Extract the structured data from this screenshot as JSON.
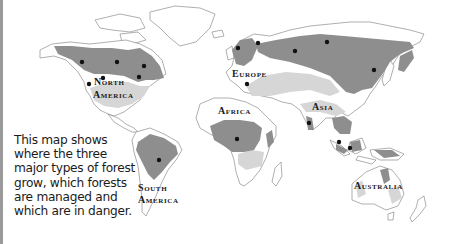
{
  "map": {
    "type": "world-forest-map",
    "colors": {
      "land": "#ffffff",
      "coastline": "#8c8c8c",
      "forest_dark": "#8e8e8e",
      "forest_light": "#d6d6d6",
      "marker": "#111111",
      "frame_border": "#9a9a9a"
    },
    "legend": null
  },
  "labels": {
    "north_america_1": "North",
    "north_america_2": "America",
    "south_america_1": "South",
    "south_america_2": "America",
    "europe": "Europe",
    "africa": "Africa",
    "asia": "Asia",
    "australia": "Australia"
  },
  "caption": {
    "text": "This map shows where the three major types of forest grow, which forests are managed and which are in danger."
  },
  "markers": [
    {
      "region": "North America",
      "x": 82,
      "y": 62
    },
    {
      "region": "North America",
      "x": 117,
      "y": 62
    },
    {
      "region": "North America",
      "x": 144,
      "y": 66
    },
    {
      "region": "North America",
      "x": 139,
      "y": 77
    },
    {
      "region": "North America",
      "x": 103,
      "y": 78
    },
    {
      "region": "North America",
      "x": 89,
      "y": 84
    },
    {
      "region": "Europe",
      "x": 238,
      "y": 48
    },
    {
      "region": "Europe",
      "x": 258,
      "y": 43
    },
    {
      "region": "Europe",
      "x": 295,
      "y": 51
    },
    {
      "region": "Asia",
      "x": 327,
      "y": 42
    },
    {
      "region": "Asia",
      "x": 374,
      "y": 70
    },
    {
      "region": "Europe",
      "x": 247,
      "y": 84
    },
    {
      "region": "South America",
      "x": 159,
      "y": 160
    },
    {
      "region": "Africa",
      "x": 237,
      "y": 139
    },
    {
      "region": "Asia",
      "x": 309,
      "y": 123
    },
    {
      "region": "Asia",
      "x": 339,
      "y": 142
    },
    {
      "region": "Asia",
      "x": 350,
      "y": 148
    }
  ]
}
